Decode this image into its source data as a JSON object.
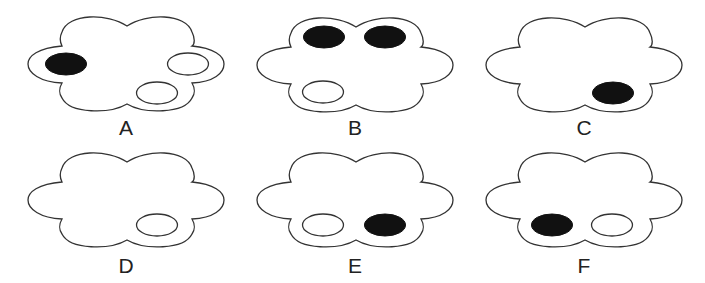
{
  "figures": [
    {
      "label": "A",
      "x": 28,
      "y": 15,
      "ellipses": [
        {
          "cx": 66,
          "cy": 64,
          "filled": true
        },
        {
          "cx": 188,
          "cy": 64,
          "filled": false
        },
        {
          "cx": 157,
          "cy": 93,
          "filled": false
        }
      ]
    },
    {
      "label": "B",
      "x": 257,
      "y": 17,
      "ellipses": [
        {
          "cx": 324,
          "cy": 37,
          "filled": true
        },
        {
          "cx": 385,
          "cy": 37,
          "filled": true
        },
        {
          "cx": 323,
          "cy": 92,
          "filled": false
        }
      ]
    },
    {
      "label": "C",
      "x": 486,
      "y": 17,
      "ellipses": [
        {
          "cx": 613,
          "cy": 93,
          "filled": true
        }
      ]
    },
    {
      "label": "D",
      "x": 28,
      "y": 153,
      "ellipses": [
        {
          "cx": 157,
          "cy": 225,
          "filled": false
        }
      ]
    },
    {
      "label": "E",
      "x": 257,
      "y": 153,
      "ellipses": [
        {
          "cx": 323,
          "cy": 225,
          "filled": false
        },
        {
          "cx": 385,
          "cy": 225,
          "filled": true
        }
      ]
    },
    {
      "label": "F",
      "x": 486,
      "y": 153,
      "ellipses": [
        {
          "cx": 552,
          "cy": 225,
          "filled": true
        },
        {
          "cx": 612,
          "cy": 225,
          "filled": false
        }
      ]
    }
  ],
  "labels": {
    "a": "A",
    "b": "B",
    "c": "C",
    "d": "D",
    "e": "E",
    "f": "F"
  }
}
